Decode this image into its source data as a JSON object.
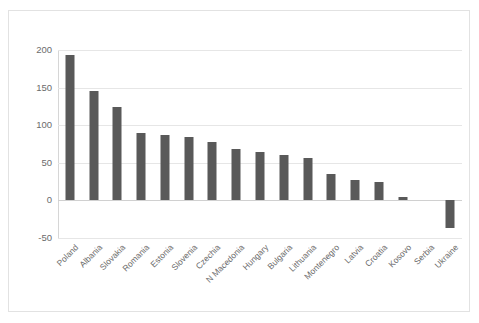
{
  "chart_data": {
    "type": "bar",
    "title": "",
    "xlabel": "",
    "ylabel": "",
    "ylim": [
      -50,
      200
    ],
    "yticks": [
      200,
      150,
      100,
      50,
      0,
      -50
    ],
    "ytick_labels": [
      "200",
      "150",
      "100",
      "50",
      "0",
      "-50"
    ],
    "grid": true,
    "legend": "none",
    "bar_color": "#595959",
    "categories": [
      "Poland",
      "Albania",
      "Slovakia",
      "Romania",
      "Estonia",
      "Slovenia",
      "Czechia",
      "N Macedonia",
      "Hungary",
      "Bulgaria",
      "Lithuania",
      "Montenegro",
      "Latvia",
      "Croatia",
      "Kosovo",
      "Serbia",
      "Ukraine"
    ],
    "values": [
      193,
      146,
      124,
      89,
      87,
      84,
      77,
      68,
      65,
      61,
      56,
      35,
      27,
      25,
      4,
      0,
      -37
    ]
  }
}
